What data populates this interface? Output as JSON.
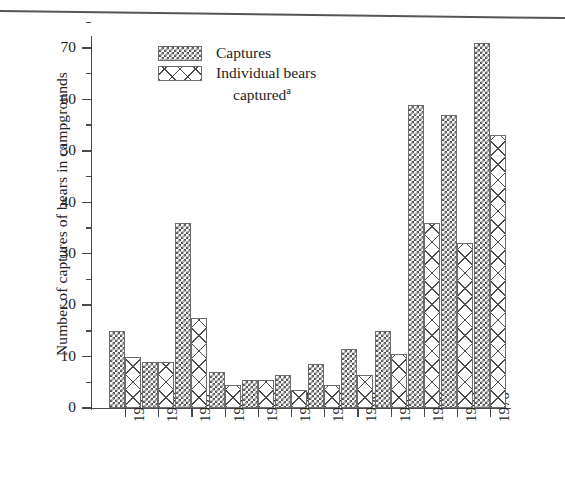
{
  "figure": {
    "y_axis_title": "Number of captures of bears in campgrounds",
    "top_rule": "horizontal-rule"
  },
  "legend": {
    "items": [
      {
        "key": "captures",
        "label": "Captures",
        "swatch": "dense-checker-swatch"
      },
      {
        "key": "individual",
        "label": "Individual bears",
        "label_line2": "captured",
        "superscript": "a",
        "swatch": "coarse-crosshatch-swatch"
      }
    ]
  },
  "chart_data": {
    "type": "bar",
    "title": "",
    "xlabel": "",
    "ylabel": "Number of captures of bears in campgrounds",
    "categories": [
      "1959",
      "1960",
      "1961",
      "1962",
      "1963",
      "1964",
      "1965",
      "1966",
      "1967",
      "1968",
      "1969",
      "1970"
    ],
    "series": [
      {
        "name": "Captures",
        "values": [
          15,
          9,
          36,
          7,
          5.5,
          6.5,
          8.5,
          11.5,
          15,
          59,
          57,
          71
        ]
      },
      {
        "name": "Individual bears captured",
        "values": [
          10,
          9,
          17.5,
          4.5,
          5.5,
          3.5,
          4.5,
          6.5,
          10.5,
          36,
          32,
          53
        ]
      }
    ],
    "ylim": [
      0,
      75
    ],
    "yticks_major": [
      0,
      10,
      20,
      30,
      40,
      50,
      60,
      70
    ],
    "yticks_minor": [
      5,
      15,
      25,
      35,
      45,
      55,
      65,
      75
    ],
    "ytick_labels": [
      "0",
      "10",
      "20",
      "30",
      "40",
      "50",
      "60",
      "70"
    ],
    "grid": false,
    "legend_position": "top-center"
  }
}
